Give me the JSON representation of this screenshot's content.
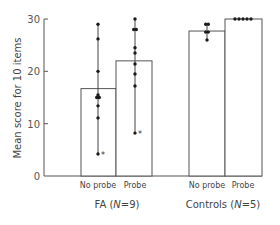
{
  "chart_data": {
    "type": "bar",
    "title": "",
    "ylabel": "Mean score for 10 items",
    "xlabel": "",
    "ylim": [
      0,
      30
    ],
    "yticks": [
      0,
      10,
      20,
      30
    ],
    "grid": false,
    "legend": null,
    "groups": [
      {
        "label": "FA",
        "n_label": "N",
        "n": 9,
        "label_full": "FA (N=9)"
      },
      {
        "label": "Controls",
        "n_label": "N",
        "n": 5,
        "label_full": "Controls (N=5)"
      }
    ],
    "categories": [
      "No probe",
      "Probe",
      "No probe",
      "Probe"
    ],
    "series": [
      {
        "name": "Mean",
        "values": [
          16.7,
          22.0,
          27.7,
          30.0
        ]
      }
    ],
    "bars": [
      {
        "group": "FA",
        "condition": "No probe",
        "mean": 16.7,
        "points": [
          29,
          26.2,
          20,
          15.5,
          15,
          15,
          13.4,
          11.1,
          4.2
        ],
        "asterisk_point": 4.2
      },
      {
        "group": "FA",
        "condition": "Probe",
        "mean": 22.0,
        "points": [
          30,
          28,
          28,
          24.5,
          23.5,
          21.4,
          19.5,
          17.2,
          8.2
        ],
        "asterisk_point": 8.2
      },
      {
        "group": "Controls",
        "condition": "No probe",
        "mean": 27.7,
        "points": [
          29,
          29,
          27.5,
          27.5,
          26
        ]
      },
      {
        "group": "Controls",
        "condition": "Probe",
        "mean": 30.0,
        "points": [
          30,
          30,
          30,
          30,
          30
        ]
      }
    ],
    "annotations": [
      "* beside lowest FA scores"
    ]
  },
  "labels": {
    "y_axis": "Mean score for 10 items",
    "ticks": [
      "0",
      "10",
      "20",
      "30"
    ],
    "x_ticks": [
      "No probe",
      "Probe",
      "No probe",
      "Probe"
    ],
    "group_fa": "FA (",
    "group_fa_n": "N",
    "group_fa_end": "=9)",
    "group_controls": "Controls (",
    "group_controls_n": "N",
    "group_controls_end": "=5)",
    "asterisk": "*"
  }
}
